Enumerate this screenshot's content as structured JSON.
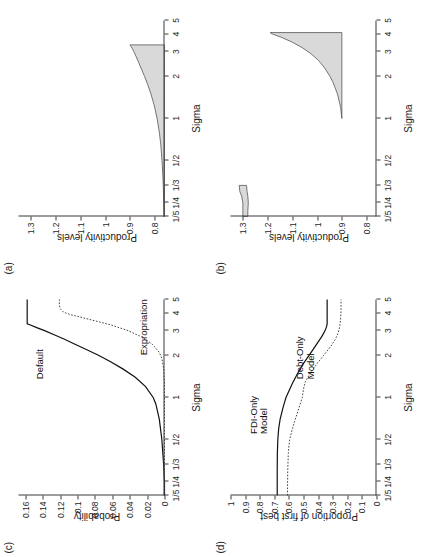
{
  "figure": {
    "rotation_deg": -90,
    "panels_order": [
      "a",
      "b",
      "c",
      "d"
    ]
  },
  "axis": {
    "x_title": "Sigma",
    "x_ticks": [
      "1/5",
      "1/4",
      "1/3",
      "1/2",
      "1",
      "2",
      "3",
      "4",
      "5"
    ],
    "x_tick_values": [
      0.2,
      0.25,
      0.3333,
      0.5,
      1,
      2,
      3,
      4,
      5
    ]
  },
  "panels": {
    "a": {
      "tag": "(a)",
      "y_title": "Productivity levels",
      "y_ticks": [
        "0.8",
        "0.9",
        "1",
        "1.1",
        "1.2",
        "1.3"
      ],
      "curve_labels": []
    },
    "b": {
      "tag": "(b)",
      "y_title": "Productivity levels",
      "y_ticks": [
        "0.8",
        "0.9",
        "1",
        "1.1",
        "1.2",
        "1.3"
      ],
      "curve_labels": []
    },
    "c": {
      "tag": "(c)",
      "y_title": "Probability",
      "y_ticks": [
        "0",
        "0.02",
        "0.04",
        "0.06",
        "0.08",
        "0.1",
        "0.12",
        "0.14",
        "0.16"
      ],
      "curve_labels": [
        "Default",
        "Expropriation"
      ]
    },
    "d": {
      "tag": "(d)",
      "y_title": "Proportion of first best",
      "y_ticks": [
        "0",
        "0.1",
        "0.2",
        "0.3",
        "0.4",
        "0.5",
        "0.6",
        "0.7",
        "0.8",
        "0.9",
        "1"
      ],
      "curve_labels": [
        "FDI-Only\nModel",
        "Debt-Only\nModel"
      ]
    }
  },
  "colors": {
    "shade_fill": "#d9d9d9",
    "shade_stroke": "#555555",
    "solid_line": "#111111",
    "dotted_line": "#444444",
    "axis": "#3a3a3a",
    "text": "#1a1a1a",
    "background": "#ffffff"
  },
  "chart_data": [
    {
      "id": "a",
      "type": "area",
      "title": "(a)",
      "xlabel": "Sigma",
      "ylabel": "Productivity levels",
      "xlim": [
        0.2,
        5
      ],
      "ylim": [
        0.76,
        1.35
      ],
      "xticks": [
        0.2,
        0.25,
        0.3333,
        0.5,
        1,
        2,
        3,
        4,
        5
      ],
      "xticklabels": [
        "1/5",
        "1/4",
        "1/3",
        "1/2",
        "1",
        "2",
        "3",
        "4",
        "5"
      ],
      "yticks": [
        0.8,
        0.9,
        1,
        1.1,
        1.2,
        1.3
      ],
      "grid": false,
      "legend": "none",
      "series": [
        {
          "name": "productivity band (shaded support)",
          "x": [
            0.2,
            0.25,
            0.3333,
            0.4,
            0.5,
            0.65,
            0.8,
            1.0,
            1.25,
            1.5,
            1.75,
            2.0,
            2.25,
            2.5,
            2.75,
            3.0,
            3.15,
            3.3,
            3.35
          ],
          "upper": [
            0.762,
            0.763,
            0.765,
            0.767,
            0.77,
            0.775,
            0.781,
            0.79,
            0.802,
            0.815,
            0.828,
            0.841,
            0.853,
            0.864,
            0.874,
            0.884,
            0.89,
            0.897,
            0.9
          ],
          "lower": [
            0.76,
            0.76,
            0.76,
            0.76,
            0.76,
            0.76,
            0.76,
            0.76,
            0.76,
            0.76,
            0.76,
            0.76,
            0.76,
            0.76,
            0.76,
            0.76,
            0.76,
            0.76,
            0.76
          ]
        }
      ]
    },
    {
      "id": "b",
      "type": "area",
      "title": "(b)",
      "xlabel": "Sigma",
      "ylabel": "Productivity levels",
      "xlim": [
        0.2,
        5
      ],
      "ylim": [
        0.76,
        1.35
      ],
      "xticks": [
        0.2,
        0.25,
        0.3333,
        0.5,
        1,
        2,
        3,
        4,
        5
      ],
      "xticklabels": [
        "1/5",
        "1/4",
        "1/3",
        "1/2",
        "1",
        "2",
        "3",
        "4",
        "5"
      ],
      "yticks": [
        0.8,
        0.9,
        1,
        1.1,
        1.2,
        1.3
      ],
      "grid": false,
      "legend": "none",
      "series": [
        {
          "name": "low-sigma shaded block",
          "x": [
            0.2,
            0.22,
            0.25,
            0.28,
            0.3,
            0.3333
          ],
          "upper": [
            1.3,
            1.3,
            1.3,
            1.305,
            1.312,
            1.315
          ],
          "lower": [
            1.28,
            1.28,
            1.278,
            1.28,
            1.283,
            1.285
          ]
        },
        {
          "name": "high-sigma shaded wedge",
          "x": [
            1.0,
            1.2,
            1.5,
            1.8,
            2.0,
            2.3,
            2.6,
            2.9,
            3.2,
            3.5,
            3.8,
            4.0,
            4.1
          ],
          "upper": [
            0.9,
            0.905,
            0.918,
            0.935,
            0.948,
            0.97,
            0.995,
            1.025,
            1.06,
            1.1,
            1.145,
            1.18,
            1.19
          ],
          "lower": [
            0.9,
            0.9,
            0.9,
            0.9,
            0.9,
            0.9,
            0.9,
            0.9,
            0.9,
            0.9,
            0.9,
            0.9,
            0.9
          ]
        }
      ]
    },
    {
      "id": "c",
      "type": "line",
      "title": "(c)",
      "xlabel": "Sigma",
      "ylabel": "Probability",
      "xlim": [
        0.2,
        5
      ],
      "ylim": [
        0,
        0.168
      ],
      "xticks": [
        0.2,
        0.25,
        0.3333,
        0.5,
        1,
        2,
        3,
        4,
        5
      ],
      "xticklabels": [
        "1/5",
        "1/4",
        "1/3",
        "1/2",
        "1",
        "2",
        "3",
        "4",
        "5"
      ],
      "yticks": [
        0,
        0.02,
        0.04,
        0.06,
        0.08,
        0.1,
        0.12,
        0.14,
        0.16
      ],
      "grid": false,
      "legend": "inline-annotations",
      "series": [
        {
          "name": "Default",
          "style": "solid",
          "x": [
            0.2,
            0.25,
            0.3333,
            0.5,
            0.7,
            0.9,
            1.0,
            1.2,
            1.4,
            1.6,
            1.8,
            2.0,
            2.2,
            2.4,
            2.6,
            2.8,
            3.0,
            3.15,
            3.3,
            3.35,
            4.0,
            5.0
          ],
          "y": [
            0.0,
            0.0,
            0.001,
            0.003,
            0.006,
            0.01,
            0.013,
            0.022,
            0.034,
            0.048,
            0.062,
            0.076,
            0.09,
            0.103,
            0.115,
            0.127,
            0.138,
            0.147,
            0.155,
            0.158,
            0.158,
            0.158
          ]
        },
        {
          "name": "Expropriation",
          "style": "dotted",
          "x": [
            0.2,
            0.4,
            0.6,
            0.8,
            1.0,
            1.3,
            1.6,
            1.9,
            2.1,
            2.4,
            2.7,
            3.0,
            3.3,
            3.6,
            3.9,
            4.05,
            4.3,
            4.6,
            5.0
          ],
          "y": [
            0.0,
            0.0,
            0.0,
            0.0,
            0.0,
            0.0,
            0.001,
            0.003,
            0.006,
            0.014,
            0.026,
            0.042,
            0.062,
            0.086,
            0.108,
            0.116,
            0.12,
            0.121,
            0.121
          ]
        }
      ]
    },
    {
      "id": "d",
      "type": "line",
      "title": "(d)",
      "xlabel": "Sigma",
      "ylabel": "Proportion of first best",
      "xlim": [
        0.2,
        5
      ],
      "ylim": [
        0,
        1
      ],
      "xticks": [
        0.2,
        0.25,
        0.3333,
        0.5,
        1,
        2,
        3,
        4,
        5
      ],
      "xticklabels": [
        "1/5",
        "1/4",
        "1/3",
        "1/2",
        "1",
        "2",
        "3",
        "4",
        "5"
      ],
      "yticks": [
        0,
        0.1,
        0.2,
        0.3,
        0.4,
        0.5,
        0.6,
        0.7,
        0.8,
        0.9,
        1
      ],
      "grid": false,
      "legend": "inline-annotations",
      "series": [
        {
          "name": "Debt-Only Model",
          "style": "solid",
          "x": [
            0.2,
            0.3,
            0.4,
            0.5,
            0.6,
            0.7,
            0.85,
            1.0,
            1.25,
            1.5,
            1.75,
            2.0,
            2.25,
            2.5,
            2.75,
            3.0,
            3.2,
            3.35,
            4.0,
            5.0
          ],
          "y": [
            0.68,
            0.68,
            0.679,
            0.676,
            0.67,
            0.66,
            0.64,
            0.62,
            0.578,
            0.538,
            0.5,
            0.462,
            0.428,
            0.398,
            0.372,
            0.352,
            0.342,
            0.338,
            0.338,
            0.338
          ]
        },
        {
          "name": "FDI-Only Model",
          "style": "dotted",
          "x": [
            0.2,
            0.3,
            0.4,
            0.45,
            0.5,
            0.6,
            0.7,
            0.85,
            1.0,
            1.15,
            1.3,
            1.5,
            1.75,
            2.0,
            2.3,
            2.6,
            2.9,
            3.2,
            3.6,
            4.0,
            4.1,
            4.5,
            5.0
          ],
          "y": [
            0.61,
            0.608,
            0.604,
            0.6,
            0.595,
            0.576,
            0.556,
            0.53,
            0.508,
            0.5,
            0.487,
            0.452,
            0.406,
            0.362,
            0.315,
            0.282,
            0.262,
            0.252,
            0.246,
            0.244,
            0.243,
            0.243,
            0.243
          ]
        }
      ]
    }
  ]
}
